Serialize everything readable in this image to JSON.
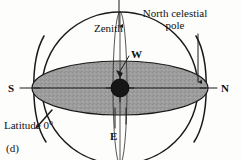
{
  "figure": {
    "caption": "(d)",
    "title_implicit": "Celestial sphere for an observer at the equator",
    "labels": {
      "zenith": "Zenith",
      "north_celestial_pole_line1": "North celestial",
      "north_celestial_pole_line2": "pole",
      "west": "W",
      "east": "E",
      "south": "S",
      "north": "N",
      "latitude": "Latitude 0°"
    },
    "colors": {
      "ink": "#1a1a1a",
      "horizon_plane": "#9a9a9a",
      "observer": "#161616",
      "background": "#fdfdfc"
    },
    "geometry_notes": {
      "celestial_sphere_center_x": 120,
      "celestial_sphere_center_y": 88,
      "celestial_sphere_radius": 78,
      "horizon_ellipse_rx": 88,
      "horizon_ellipse_ry": 27,
      "observer_radius": 9,
      "zenith_direction": "vertical up",
      "pole_direction": "horizontal to N (latitude 0°)"
    },
    "elements": [
      "celestial-sphere-outline",
      "horizon-plane-ellipse",
      "meridian-ellipse",
      "observer-marker",
      "zenith-arrow",
      "north-celestial-pole-arrow",
      "west-leader-line",
      "east-tick-lines",
      "south-cardinal-tick",
      "north-cardinal-tick",
      "latitude-leader-line"
    ]
  }
}
